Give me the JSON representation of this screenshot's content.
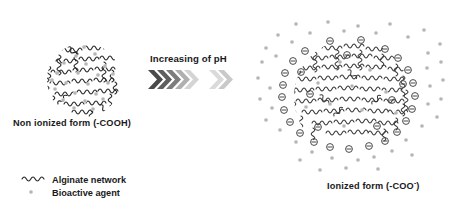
{
  "figure": {
    "background_color": "#ffffff",
    "width": 452,
    "height": 209
  },
  "left_structure": {
    "name": "non-ionized collapsed alginate network",
    "label": "Non ionized form  (-COOH)",
    "center_x": 84,
    "center_y": 80,
    "radius": 37,
    "chain_color": "#2b2b2b",
    "agent_color": "#b8b8b8",
    "agent_count": 22,
    "state": "collapsed"
  },
  "center_arrow": {
    "label": "Increasing of pH",
    "chevron_group_1_count": 5,
    "chevron_group_2_count": 2,
    "colors": [
      "#4a4a4a",
      "#5e5e5e",
      "#7d7d7d",
      "#b0b0b0",
      "#d2d2d2",
      "#d9d9d9",
      "#c9c9c9"
    ],
    "direction": "right"
  },
  "right_structure": {
    "name": "ionized swollen alginate network",
    "label_prefix": "Ionized form (-COO",
    "label_sup": "-",
    "label_suffix": ")",
    "center_x": 352,
    "center_y": 97,
    "radius": 58,
    "chain_color": "#3a3a3a",
    "charge_symbol": "minus-in-circle",
    "charge_color": "#4a4a4a",
    "charge_count": 30,
    "agent_color": "#b8b8b8",
    "agent_count": 52,
    "state": "swollen"
  },
  "legend": {
    "items": [
      {
        "symbol": "wavy-line",
        "label": "Alginate network",
        "color": "#2b2b2b"
      },
      {
        "symbol": "dot",
        "label": "Bioactive agent",
        "color": "#b8b8b8"
      }
    ]
  }
}
